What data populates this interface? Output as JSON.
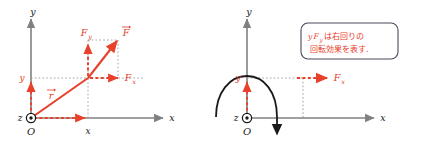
{
  "figure": {
    "colors": {
      "axis": "#808080",
      "vector_red": "#e8402a",
      "guide_gray": "#9a9a9a",
      "curve_black": "#1a1a1a",
      "box_border": "#4a4a5a",
      "background": "#ffffff"
    }
  },
  "left_panel": {
    "name": "force-decomposition-diagram",
    "axes": {
      "y_axis_label": "y",
      "x_axis_label": "x"
    },
    "origin": {
      "z_label": "z",
      "origin_label": "O",
      "symbol": "circle-dot-out-of-page"
    },
    "tick_labels": {
      "x_tick": "x",
      "y_tick": "y"
    },
    "vectors": {
      "position_vector": "r",
      "force_vector": "F",
      "force_x_component": "F",
      "force_x_subscript": "x",
      "force_y_component": "F",
      "force_y_subscript": "y"
    }
  },
  "right_panel": {
    "name": "rotation-effect-diagram",
    "axes": {
      "y_axis_label": "y",
      "x_axis_label": "x"
    },
    "origin": {
      "z_label": "z",
      "origin_label": "O",
      "symbol": "circle-dot-out-of-page"
    },
    "tick_labels": {
      "y_tick": "y"
    },
    "vectors": {
      "force_x_component": "F",
      "force_x_subscript": "x"
    },
    "rotation": {
      "direction": "clockwise",
      "annotation_symbol": "curved-arrow-clockwise"
    },
    "callout": {
      "line1_formula_base": "y",
      "line1_formula_f": "F",
      "line1_formula_sub": "y",
      "line1_text": "は右回りの",
      "line2_text": "回転効果を表す."
    }
  }
}
